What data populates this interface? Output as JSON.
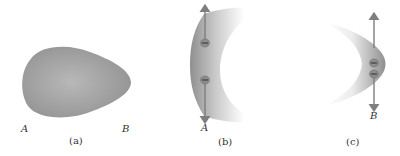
{
  "figure": {
    "panels": [
      {
        "id": "a",
        "caption": "(a)",
        "point_labels": [
          "A",
          "B"
        ]
      },
      {
        "id": "b",
        "caption": "(b)",
        "point_labels": [
          "A"
        ],
        "charges": [
          "−",
          "−"
        ]
      },
      {
        "id": "c",
        "caption": "(c)",
        "point_labels": [
          "B"
        ],
        "charges": [
          "−",
          "−"
        ]
      }
    ]
  },
  "colors": {
    "shape_fill": "#9a9a9a",
    "shape_light": "#c4c4c4",
    "arrow": "#8a8a8a",
    "text": "#333333",
    "background": "#ffffff"
  }
}
